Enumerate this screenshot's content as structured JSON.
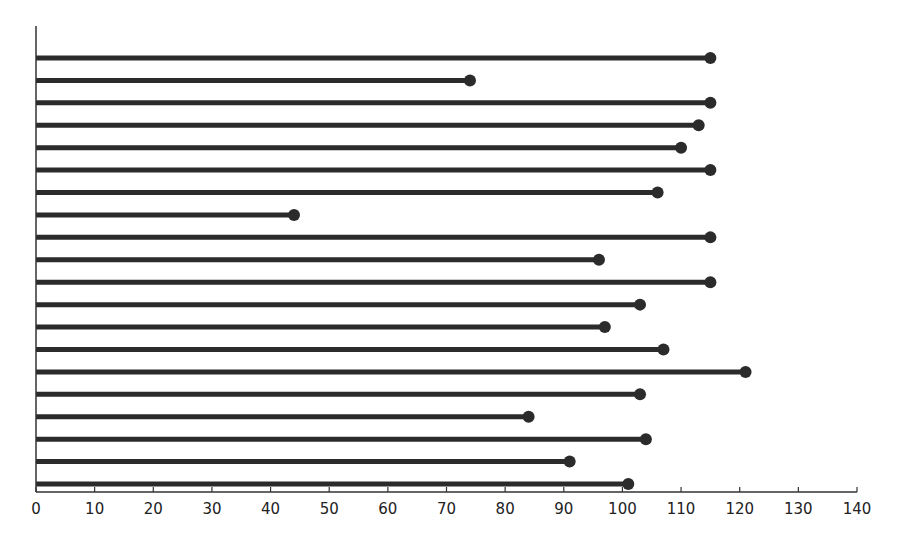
{
  "chart_data": {
    "type": "bar",
    "subtype": "lollipop-horizontal",
    "title": "",
    "xlabel": "",
    "ylabel": "",
    "xlim": [
      0,
      140
    ],
    "xticks": [
      0,
      10,
      20,
      30,
      40,
      50,
      60,
      70,
      80,
      90,
      100,
      110,
      120,
      130,
      140
    ],
    "categories": [
      "1",
      "2",
      "3",
      "4",
      "5",
      "6",
      "7",
      "8",
      "9",
      "10",
      "11",
      "12",
      "13",
      "14",
      "15",
      "16",
      "17",
      "18",
      "19",
      "20"
    ],
    "values": [
      115,
      74,
      115,
      113,
      110,
      115,
      106,
      44,
      115,
      96,
      115,
      103,
      97,
      107,
      121,
      103,
      84,
      104,
      91,
      101
    ],
    "grid": false,
    "legend": null,
    "colors": {
      "bar": "#2b2b2b",
      "axis": "#333333"
    }
  }
}
